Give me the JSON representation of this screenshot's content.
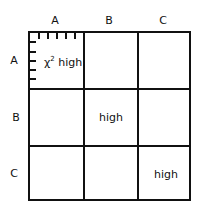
{
  "columns": [
    "A",
    "B",
    "C"
  ],
  "rows": [
    "A",
    "B",
    "C"
  ],
  "cells": {
    "AA": {
      "symbol": "χ",
      "superscript": "2",
      "text": "high"
    },
    "BB": {
      "text": "high"
    },
    "CC": {
      "text": "high"
    }
  },
  "ticks": {
    "top": 6,
    "left": 5
  }
}
